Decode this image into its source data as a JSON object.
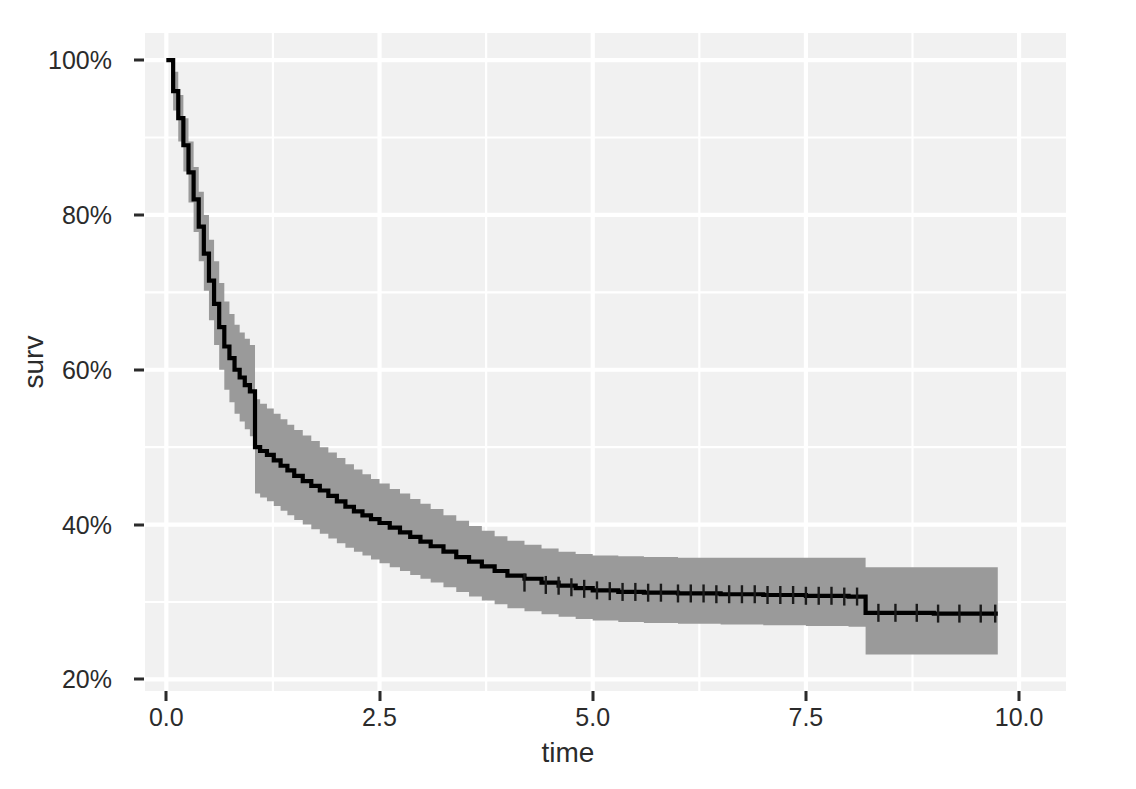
{
  "figure": {
    "background_color": "#ffffff",
    "panel_background_color": "#f1f1f1",
    "grid_color": "#ffffff",
    "axis_text_color": "#2b2b2b"
  },
  "axes": {
    "x": {
      "title": "time",
      "tick_labels": [
        "0.0",
        "2.5",
        "5.0",
        "7.5",
        "10.0"
      ],
      "tick_values": [
        0,
        2.5,
        5,
        7.5,
        10
      ],
      "minor_tick_values": [
        1.25,
        3.75,
        6.25,
        8.75
      ],
      "limits": [
        -0.25,
        10.55
      ]
    },
    "y": {
      "title": "surv",
      "tick_labels": [
        "20%",
        "40%",
        "60%",
        "80%",
        "100%"
      ],
      "tick_values": [
        0.2,
        0.4,
        0.6,
        0.8,
        1.0
      ],
      "minor_tick_values": [
        0.3,
        0.5,
        0.7,
        0.9
      ],
      "limits": [
        0.185,
        1.035
      ]
    }
  },
  "chart_data": {
    "type": "line",
    "title": "",
    "subtitle": "",
    "xlabel": "time",
    "ylabel": "surv",
    "xlim": [
      -0.25,
      10.55
    ],
    "ylim": [
      0.185,
      1.035
    ],
    "grid": true,
    "legend_position": "none",
    "plot_style": "kaplan-meier step function with confidence ribbon and censoring marks",
    "line_color": "#000000",
    "ribbon_color": "#9a9a9a",
    "series": [
      {
        "name": "surv",
        "type": "step",
        "x": [
          0.0,
          0.08,
          0.14,
          0.2,
          0.26,
          0.32,
          0.38,
          0.44,
          0.5,
          0.56,
          0.62,
          0.68,
          0.74,
          0.8,
          0.86,
          0.92,
          0.98,
          1.04,
          1.1,
          1.18,
          1.26,
          1.34,
          1.42,
          1.5,
          1.6,
          1.7,
          1.8,
          1.9,
          2.0,
          2.1,
          2.2,
          2.3,
          2.4,
          2.5,
          2.62,
          2.74,
          2.86,
          2.98,
          3.1,
          3.25,
          3.4,
          3.55,
          3.7,
          3.85,
          4.0,
          4.2,
          4.4,
          4.6,
          4.8,
          5.0,
          5.3,
          5.6,
          6.0,
          6.5,
          7.0,
          7.5,
          8.0,
          8.2,
          8.6,
          9.0,
          9.4,
          9.75
        ],
        "y": [
          1.0,
          0.96,
          0.925,
          0.89,
          0.855,
          0.82,
          0.785,
          0.75,
          0.715,
          0.685,
          0.655,
          0.63,
          0.615,
          0.6,
          0.59,
          0.58,
          0.572,
          0.5,
          0.495,
          0.49,
          0.483,
          0.476,
          0.47,
          0.463,
          0.456,
          0.45,
          0.444,
          0.437,
          0.43,
          0.423,
          0.417,
          0.412,
          0.407,
          0.402,
          0.396,
          0.39,
          0.384,
          0.378,
          0.372,
          0.365,
          0.358,
          0.352,
          0.346,
          0.34,
          0.334,
          0.33,
          0.325,
          0.321,
          0.318,
          0.315,
          0.313,
          0.312,
          0.311,
          0.31,
          0.309,
          0.308,
          0.307,
          0.286,
          0.286,
          0.285,
          0.285,
          0.285
        ]
      }
    ],
    "confidence_band": {
      "name": "95% confidence interval",
      "x": [
        0.0,
        0.08,
        0.14,
        0.2,
        0.26,
        0.32,
        0.38,
        0.44,
        0.5,
        0.56,
        0.62,
        0.68,
        0.74,
        0.8,
        0.86,
        0.92,
        0.98,
        1.04,
        1.1,
        1.18,
        1.26,
        1.34,
        1.42,
        1.5,
        1.6,
        1.7,
        1.8,
        1.9,
        2.0,
        2.1,
        2.2,
        2.3,
        2.4,
        2.5,
        2.62,
        2.74,
        2.86,
        2.98,
        3.1,
        3.25,
        3.4,
        3.55,
        3.7,
        3.85,
        4.0,
        4.2,
        4.4,
        4.6,
        4.8,
        5.0,
        5.3,
        5.6,
        6.0,
        6.5,
        7.0,
        7.5,
        8.0,
        8.2,
        8.6,
        9.0,
        9.4,
        9.75
      ],
      "upper": [
        1.0,
        0.985,
        0.955,
        0.925,
        0.895,
        0.862,
        0.83,
        0.8,
        0.768,
        0.74,
        0.712,
        0.688,
        0.672,
        0.658,
        0.648,
        0.64,
        0.632,
        0.562,
        0.556,
        0.55,
        0.543,
        0.536,
        0.529,
        0.522,
        0.515,
        0.508,
        0.5,
        0.493,
        0.486,
        0.478,
        0.471,
        0.465,
        0.459,
        0.453,
        0.446,
        0.44,
        0.433,
        0.427,
        0.42,
        0.412,
        0.405,
        0.398,
        0.392,
        0.385,
        0.379,
        0.374,
        0.369,
        0.365,
        0.362,
        0.36,
        0.359,
        0.358,
        0.357,
        0.357,
        0.357,
        0.357,
        0.357,
        0.345,
        0.345,
        0.345,
        0.345,
        0.345
      ],
      "lower": [
        1.0,
        0.935,
        0.895,
        0.856,
        0.816,
        0.778,
        0.74,
        0.702,
        0.664,
        0.632,
        0.6,
        0.574,
        0.558,
        0.543,
        0.533,
        0.523,
        0.514,
        0.44,
        0.435,
        0.43,
        0.424,
        0.418,
        0.412,
        0.406,
        0.4,
        0.394,
        0.388,
        0.382,
        0.376,
        0.37,
        0.365,
        0.36,
        0.355,
        0.35,
        0.345,
        0.34,
        0.335,
        0.33,
        0.325,
        0.319,
        0.313,
        0.307,
        0.302,
        0.297,
        0.292,
        0.288,
        0.284,
        0.281,
        0.278,
        0.276,
        0.274,
        0.273,
        0.272,
        0.271,
        0.27,
        0.269,
        0.268,
        0.232,
        0.232,
        0.232,
        0.232,
        0.232
      ]
    },
    "censor_marks": {
      "description": "vertical plus-shaped tick marks drawn on the step line",
      "x": [
        4.2,
        4.45,
        4.6,
        4.75,
        4.9,
        5.05,
        5.2,
        5.35,
        5.5,
        5.65,
        5.8,
        6.0,
        6.15,
        6.3,
        6.45,
        6.6,
        6.75,
        6.9,
        7.05,
        7.2,
        7.35,
        7.5,
        7.65,
        7.8,
        7.95,
        8.1,
        8.35,
        8.55,
        8.8,
        9.05,
        9.3,
        9.55,
        9.72
      ],
      "y": [
        0.325,
        0.322,
        0.321,
        0.319,
        0.317,
        0.315,
        0.314,
        0.313,
        0.313,
        0.312,
        0.312,
        0.311,
        0.311,
        0.311,
        0.31,
        0.31,
        0.31,
        0.31,
        0.309,
        0.309,
        0.309,
        0.308,
        0.308,
        0.308,
        0.307,
        0.307,
        0.286,
        0.286,
        0.286,
        0.285,
        0.285,
        0.285,
        0.285
      ]
    }
  }
}
